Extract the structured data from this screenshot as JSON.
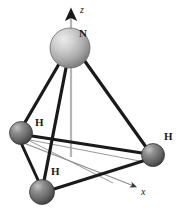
{
  "figure": {
    "name": "ammonia-molecular-geometry",
    "background_color": "#ffffff",
    "width": 182,
    "height": 213
  },
  "axes": [
    {
      "id": "z",
      "label": "z",
      "label_x": 80,
      "label_y": 6,
      "x1": 71,
      "y1": 157,
      "x2": 71,
      "y2": 12,
      "color": "#b5b5b5",
      "head_color": "#1a1a1a",
      "width": 2,
      "arrow": true
    },
    {
      "id": "x",
      "label": "x",
      "label_x": 141,
      "label_y": 188,
      "x1": 14,
      "y1": 139,
      "x2": 136,
      "y2": 187,
      "color": "#8c8c8c",
      "head_color": "#3a3a3a",
      "width": 1,
      "arrow": true
    }
  ],
  "atoms": [
    {
      "id": "n-center",
      "element": "N",
      "label": "N",
      "cx": 70,
      "cy": 48,
      "r": 20,
      "fill": "#b9b9b9",
      "highlight": "#e6e6e6",
      "shadow": "#6e6e6e",
      "stroke": "#5a5a5a",
      "label_x": 79,
      "label_y": 28
    },
    {
      "id": "h-left",
      "element": "H",
      "label": "H",
      "cx": 21,
      "cy": 133,
      "r": 11.5,
      "fill": "#6f6f6f",
      "highlight": "#c9c9c9",
      "shadow": "#3a3a3a",
      "stroke": "#2e2e2e",
      "label_x": 35,
      "label_y": 117
    },
    {
      "id": "h-right",
      "element": "H",
      "label": "H",
      "cx": 153,
      "cy": 155,
      "r": 11.5,
      "fill": "#6f6f6f",
      "highlight": "#c9c9c9",
      "shadow": "#3a3a3a",
      "stroke": "#2e2e2e",
      "label_x": 164,
      "label_y": 131
    },
    {
      "id": "h-bottom",
      "element": "H",
      "label": "H",
      "cx": 42,
      "cy": 192,
      "r": 12.5,
      "fill": "#6f6f6f",
      "highlight": "#c9c9c9",
      "shadow": "#3a3a3a",
      "stroke": "#2e2e2e",
      "label_x": 51,
      "label_y": 166
    }
  ],
  "bonds": [
    {
      "id": "bond-n-h-left",
      "from": "n-center",
      "to": "h-left",
      "x1": 59,
      "y1": 64,
      "x2": 25,
      "y2": 124,
      "color": "#1a1a1a",
      "width": 3.2
    },
    {
      "id": "bond-n-h-right",
      "from": "n-center",
      "to": "h-right",
      "x1": 84,
      "y1": 60,
      "x2": 145,
      "y2": 147,
      "color": "#1a1a1a",
      "width": 3.2
    },
    {
      "id": "bond-n-h-bottom",
      "from": "n-center",
      "to": "h-bottom",
      "x1": 66,
      "y1": 68,
      "x2": 45,
      "y2": 180,
      "color": "#1a1a1a",
      "width": 3.2
    }
  ],
  "base_edges": [
    {
      "id": "edge-hleft-hright",
      "from": "h-left",
      "to": "h-right",
      "x1": 32,
      "y1": 136,
      "x2": 142,
      "y2": 153,
      "color": "#1a1a1a",
      "width": 3.0
    },
    {
      "id": "edge-hleft-hbottom",
      "from": "h-left",
      "to": "h-bottom",
      "x1": 22,
      "y1": 145,
      "x2": 38,
      "y2": 180,
      "color": "#1a1a1a",
      "width": 3.0
    },
    {
      "id": "edge-hbottom-hright",
      "from": "h-bottom",
      "to": "h-right",
      "x1": 54,
      "y1": 189,
      "x2": 143,
      "y2": 161,
      "color": "#1a1a1a",
      "width": 3.0
    }
  ],
  "guide_lines": [
    {
      "id": "guide-hleft-to-base-right",
      "x1": 30,
      "y1": 140,
      "x2": 150,
      "y2": 163,
      "color": "#9a9a9a",
      "width": 1
    },
    {
      "id": "guide-base-back",
      "x1": 30,
      "y1": 141,
      "x2": 113,
      "y2": 183,
      "color": "#9a9a9a",
      "width": 1
    }
  ],
  "caption": {
    "molecule": "NH3",
    "shape": "trigonal pyramidal"
  }
}
